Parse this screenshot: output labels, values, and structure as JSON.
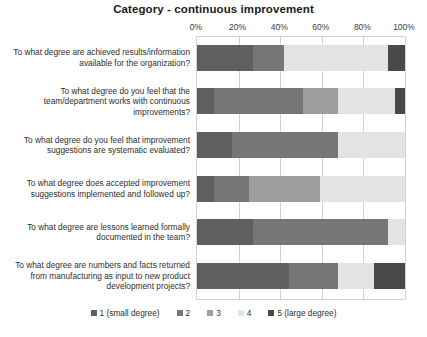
{
  "chart_data": {
    "type": "bar",
    "subtype": "stacked-horizontal-100-percent",
    "title": "Category - continuous improvement",
    "xlabel": "",
    "ylabel": "",
    "xlim": [
      0,
      100
    ],
    "x_ticks": [
      "0%",
      "20%",
      "40%",
      "60%",
      "80%",
      "100%"
    ],
    "x_tick_values": [
      0,
      20,
      40,
      60,
      80,
      100
    ],
    "grid": true,
    "legend_position": "bottom",
    "categories": [
      "To what degree are achieved results/information available for the organization?",
      "To what degree do you feel that the team/department works with continuous improvements?",
      "To what degree do you feel that improvement suggestions are systematic evaluated?",
      "To what degree does accepted improvement suggestions implemented and followed up?",
      "To what degree are lessons learned formally documented in the team?",
      "To what degree are numbers and facts returned from manufacturing as input to new product development projects?"
    ],
    "series": [
      {
        "name": "1 (small degree)",
        "color": "#5f5f5f",
        "values": [
          27,
          8,
          17,
          8,
          27,
          44
        ]
      },
      {
        "name": "2",
        "color": "#767676",
        "values": [
          15,
          43,
          51,
          17,
          65,
          24
        ]
      },
      {
        "name": "3",
        "color": "#9e9e9e",
        "values": [
          0,
          17,
          0,
          34,
          0,
          0
        ]
      },
      {
        "name": "4",
        "color": "#e3e3e3",
        "values": [
          50,
          27,
          32,
          41,
          8,
          17
        ]
      },
      {
        "name": "5 (large degree)",
        "color": "#4a4a4a",
        "values": [
          8,
          5,
          0,
          0,
          0,
          15
        ]
      }
    ]
  },
  "legend": {
    "items": [
      {
        "label": "1 (small degree)",
        "color": "#5f5f5f"
      },
      {
        "label": "2",
        "color": "#767676"
      },
      {
        "label": "3",
        "color": "#9e9e9e"
      },
      {
        "label": "4",
        "color": "#e3e3e3"
      },
      {
        "label": "5 (large degree)",
        "color": "#4a4a4a"
      }
    ]
  }
}
